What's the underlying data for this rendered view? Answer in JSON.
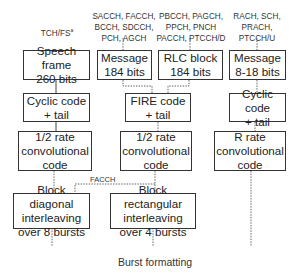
{
  "diagram": {
    "channel_labels": {
      "col1": "TCH/FS",
      "col1_sup": "a",
      "col2": "SACCH, FACCH,\nBCCH, SDCCH,\nPCH, AGCH",
      "col3": "PBCCH, PAGCH,\nPPCH, PNCH\nPACCH, PTCCH/D",
      "col4": "RACH, SCH,\nPRACH,\nPTCCH/U"
    },
    "row1": {
      "speech_frame": "Speech frame\n260 bits",
      "message_184": "Message\n184 bits",
      "rlc_block": "RLC block\n184 bits",
      "message_8_18": "Message\n8-18 bits"
    },
    "row2": {
      "cyclic_left": "Cyclic code\n+ tail",
      "fire": "FIRE code\n+ tail",
      "cyclic_right": "Cyclic code\n+ tail"
    },
    "row3": {
      "half_rate_left": "1/2 rate\nconvolutional\ncode",
      "half_rate_mid": "1/2 rate\nconvolutional\ncode",
      "r_rate": "R rate\nconvolutional\ncode"
    },
    "row4": {
      "block_diagonal": "Block diagonal\ninterleaving\nover 8 bursts",
      "block_rectangular": "Block rectangular\ninterleaving\nover 4 bursts"
    },
    "facch_label": "FACCH",
    "footer": "Burst formatting"
  }
}
